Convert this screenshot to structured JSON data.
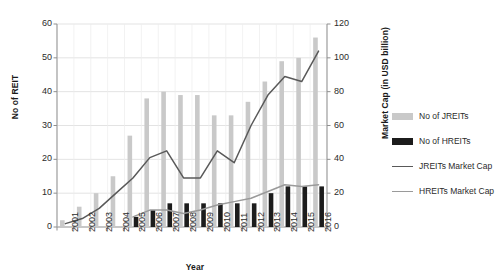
{
  "chart_data": {
    "type": "bar",
    "title": "",
    "xlabel": "Year",
    "ylabel": "No of REIT",
    "y2label": "Market Cap (in USD billion)",
    "categories": [
      "2001",
      "2002",
      "2003",
      "2004",
      "2005",
      "2006",
      "2007",
      "2008",
      "2009",
      "2010",
      "2011",
      "2012",
      "2013",
      "2014",
      "2015",
      "2016"
    ],
    "ylim": [
      0,
      60
    ],
    "yticks": [
      "0",
      "10",
      "20",
      "30",
      "40",
      "50",
      "60"
    ],
    "y2lim": [
      0,
      120
    ],
    "y2ticks": [
      "0",
      "20",
      "40",
      "60",
      "80",
      "100",
      "120"
    ],
    "grid": true,
    "legend_position": "right",
    "series": [
      {
        "name": "No of JREITs",
        "kind": "bar",
        "axis": "left",
        "color": "#c9c9c9",
        "values": [
          2,
          6,
          10,
          15,
          27,
          38,
          40,
          39,
          39,
          33,
          33,
          37,
          43,
          49,
          50,
          56
        ]
      },
      {
        "name": "No of HREITs",
        "kind": "bar",
        "axis": "left",
        "color": "#1c1c1c",
        "values": [
          0,
          0,
          0,
          0,
          3,
          5,
          7,
          7,
          7,
          7,
          7,
          7,
          10,
          12,
          12,
          12
        ]
      },
      {
        "name": "JREITs Market Cap",
        "kind": "line",
        "axis": "right",
        "color": "#595959",
        "values": [
          2,
          5,
          11,
          20,
          29,
          41,
          45,
          29,
          29,
          45,
          38,
          60,
          78,
          89,
          86,
          104
        ]
      },
      {
        "name": "HREITs Market Cap",
        "kind": "line",
        "axis": "right",
        "color": "#9a9a9a",
        "values": [
          null,
          null,
          null,
          null,
          6,
          10,
          10,
          8,
          10,
          13,
          15,
          17,
          21,
          25,
          24,
          25
        ]
      }
    ]
  },
  "axes": {
    "left_title": "No of REIT",
    "right_title": "Market Cap (in USD billion)",
    "x_title": "Year"
  },
  "legend": {
    "items": [
      {
        "label": "No of JREITs"
      },
      {
        "label": "No of HREITs"
      },
      {
        "label": "JREITs Market Cap"
      },
      {
        "label": "HREITs Market Cap"
      }
    ]
  }
}
